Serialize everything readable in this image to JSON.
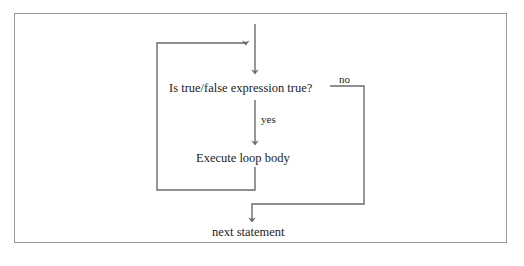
{
  "diagram": {
    "type": "flowchart",
    "colors": {
      "line": "#6b6b6b",
      "text": "#1d1d1d",
      "frame": "#9a9a9a",
      "background": "#ffffff"
    },
    "nodes": [
      {
        "id": "decision",
        "label": "Is true/false expression true?"
      },
      {
        "id": "body",
        "label": "Execute loop body"
      },
      {
        "id": "next",
        "label": "next statement"
      }
    ],
    "edge_labels": [
      {
        "id": "yes",
        "label": "yes"
      },
      {
        "id": "no",
        "label": "no"
      }
    ]
  }
}
